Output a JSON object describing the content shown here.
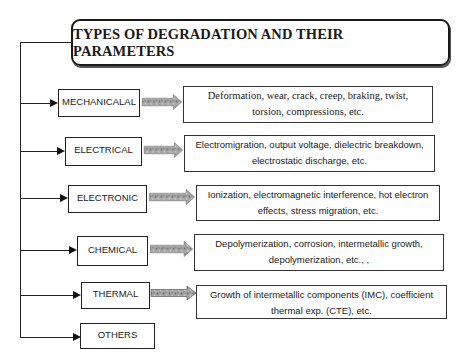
{
  "title": "TYPES OF DEGRADATION AND THEIR PARAMETERS",
  "colors": {
    "line": "#222222",
    "arrow_fill": "#9a9a9a",
    "arrow_texture": "#6e6e6e",
    "background": "#ffffff"
  },
  "categories": [
    {
      "label": "MECHANICALAL",
      "description_line1": "Deformation, wear, crack, creep, braking, twist,",
      "description_line2": "torsion, compressions, etc."
    },
    {
      "label": "ELECTRICAL",
      "description_line1": "Electromigration, output voltage, dielectric breakdown,",
      "description_line2": "electrostatic discharge, etc."
    },
    {
      "label": "ELECTRONIC",
      "description_line1": "Ionization, electromagnetic interference, hot electron",
      "description_line2": "effects, stress migration, etc."
    },
    {
      "label": "CHEMICAL",
      "description_line1": "Depolymerization, corrosion, intermetallic growth,",
      "description_line2": "depolymerization, etc., ,"
    },
    {
      "label": "THERMAL",
      "description_line1": "Growth of intermetallic components (IMC), coefficient",
      "description_line2": "thermal exp. (CTE), etc."
    },
    {
      "label": "OTHERS"
    }
  ]
}
